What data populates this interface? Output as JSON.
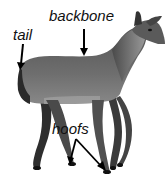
{
  "figure": {
    "style": "grayscale photo with labels",
    "labels": [
      {
        "id": "backbone",
        "text": "backbone"
      },
      {
        "id": "tail",
        "text": "tail"
      },
      {
        "id": "hoofs",
        "text": "hoofs"
      }
    ]
  },
  "colors": {
    "background": "#ffffff",
    "label_text": "#111111",
    "arrow": "#000000",
    "body_dark": "#3a3a3a",
    "body_mid": "#6a6a6a",
    "body_light": "#9a9a9a"
  }
}
